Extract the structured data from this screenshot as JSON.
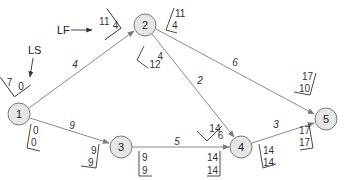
{
  "diagram": {
    "type": "network-activity-on-arrow",
    "callouts": {
      "ls_label": "LS",
      "lf_label": "LF"
    },
    "nodes": [
      {
        "id": "1",
        "label": "1"
      },
      {
        "id": "2",
        "label": "2"
      },
      {
        "id": "3",
        "label": "3"
      },
      {
        "id": "4",
        "label": "4"
      },
      {
        "id": "5",
        "label": "5"
      }
    ],
    "edges": [
      {
        "from": "1",
        "to": "2",
        "duration": "4",
        "start_box": [
          "7",
          "0"
        ],
        "end_box": [
          "11",
          "4"
        ]
      },
      {
        "from": "1",
        "to": "3",
        "duration": "9",
        "start_box": [
          "0",
          "0"
        ],
        "end_box": [
          "9",
          "9"
        ]
      },
      {
        "from": "2",
        "to": "4",
        "duration": "2",
        "start_box": [
          "12",
          "4"
        ],
        "end_box": [
          "14",
          "6"
        ]
      },
      {
        "from": "2",
        "to": "5",
        "duration": "6",
        "start_box": [
          "11",
          "4"
        ],
        "end_box": [
          "17",
          "10"
        ]
      },
      {
        "from": "3",
        "to": "4",
        "duration": "5",
        "start_box": [
          "9",
          "9"
        ],
        "end_box": [
          "14",
          "14"
        ]
      },
      {
        "from": "4",
        "to": "5",
        "duration": "3",
        "start_box": [
          "14",
          "14"
        ],
        "end_box": [
          "17",
          "17"
        ]
      }
    ]
  }
}
